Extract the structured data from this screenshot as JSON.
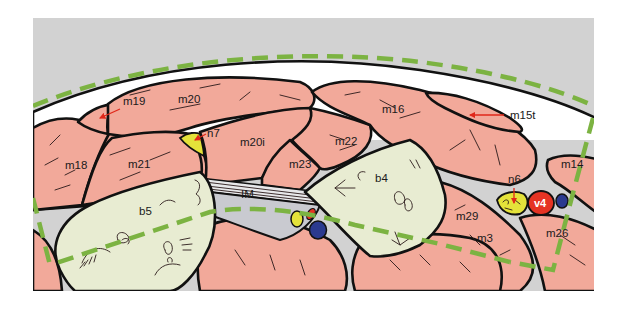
{
  "figure": {
    "type": "anatomical-illustration",
    "colors": {
      "background_gray": "#d2d2d2",
      "muscle_pink": "#f2a99a",
      "bone_pale": "#e8ecd2",
      "capsule_white": "#ffffff",
      "outline": "#111111",
      "guide_dashed_green": "#7cb342",
      "nerve_yellow": "#e4e23a",
      "vessel_red": "#e53323",
      "vessel_blue": "#2b3a8f",
      "pointer_arrow": "#e0281a",
      "interosseous_gray": "#c9cad0"
    },
    "labels": {
      "m19": "m19",
      "m20": "m20",
      "m16": "m16",
      "m15t": "m15t",
      "n7": "n7",
      "m20i": "m20i",
      "m22": "m22",
      "m18": "m18",
      "m21": "m21",
      "m23": "m23",
      "m14": "m14",
      "im": "IM",
      "b4": "b4",
      "n6": "n6",
      "v4": "v4",
      "b5": "b5",
      "m29": "m29",
      "m3": "m3",
      "m26": "m26"
    }
  }
}
